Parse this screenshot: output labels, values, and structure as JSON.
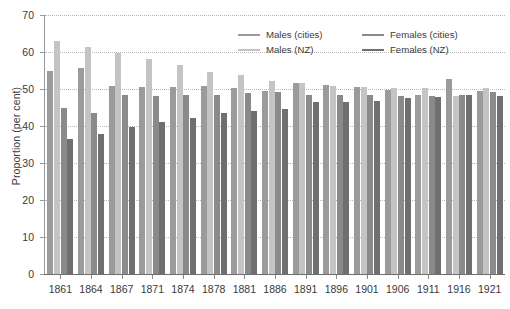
{
  "chart_data": {
    "type": "bar",
    "title": "",
    "subtitle": "",
    "xlabel": "",
    "ylabel": "Proportion (per cent)",
    "ylim": [
      0,
      70
    ],
    "ytick_step": 10,
    "yticks": [
      0,
      10,
      20,
      30,
      40,
      50,
      60,
      70
    ],
    "grid": true,
    "grid_axis": "y",
    "legend_position": "top-right",
    "categories": [
      "1861",
      "1864",
      "1867",
      "1871",
      "1874",
      "1878",
      "1881",
      "1886",
      "1891",
      "1896",
      "1901",
      "1906",
      "1911",
      "1916",
      "1921"
    ],
    "series": [
      {
        "name": "Males (cities)",
        "color": "#9b9b9b",
        "values": [
          54.8,
          55.6,
          50.7,
          50.6,
          50.6,
          50.7,
          50.2,
          49.5,
          51.6,
          51.0,
          50.6,
          49.6,
          48.3,
          52.7,
          49.4
        ]
      },
      {
        "name": "Males (NZ)",
        "color": "#c4c4c4",
        "values": [
          62.9,
          61.4,
          59.8,
          58.1,
          56.6,
          54.5,
          53.8,
          52.2,
          51.6,
          50.9,
          50.6,
          50.4,
          50.2,
          48.0,
          50.4
        ]
      },
      {
        "name": "Females (cities)",
        "color": "#8a8a8a",
        "values": [
          44.8,
          43.5,
          48.5,
          48.2,
          48.3,
          48.3,
          48.8,
          49.3,
          48.5,
          48.3,
          48.5,
          48.1,
          48.2,
          48.4,
          49.1
        ]
      },
      {
        "name": "Females (NZ)",
        "color": "#6f6f6f",
        "values": [
          36.6,
          37.8,
          39.6,
          41.0,
          42.3,
          43.6,
          44.1,
          44.6,
          46.5,
          46.4,
          46.8,
          47.6,
          47.9,
          48.3,
          48.0
        ]
      }
    ]
  },
  "legend": {
    "items": [
      {
        "label": "Males (cities)",
        "color": "#9b9b9b"
      },
      {
        "label": "Females (cities)",
        "color": "#8a8a8a"
      },
      {
        "label": "Males (NZ)",
        "color": "#c4c4c4"
      },
      {
        "label": "Females (NZ)",
        "color": "#6f6f6f"
      }
    ]
  },
  "colors": {
    "background": "#ffffff",
    "axis": "#6d6d6d",
    "gridline": "#b9b9b9",
    "text": "#3a3a3a"
  }
}
